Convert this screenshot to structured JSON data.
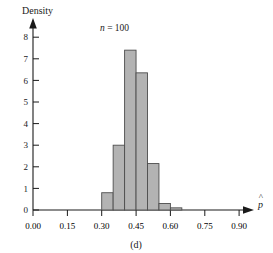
{
  "figure": {
    "caption": "(d)",
    "annotation": "n = 100",
    "annotation_var": "n",
    "annotation_rest": " = 100",
    "ylabel": "Density",
    "xlabel": "p̂",
    "xlabel_base": "p"
  },
  "chart_data": {
    "type": "bar",
    "subtype": "histogram",
    "title": "",
    "subtitle": "",
    "xlabel": "p̂",
    "ylabel": "Density",
    "annotations": [
      "n = 100",
      "(d)"
    ],
    "grid": false,
    "legend": null,
    "xlim": [
      0.0,
      0.975
    ],
    "ylim": [
      0,
      8.4
    ],
    "xticks": [
      0.0,
      0.15,
      0.3,
      0.45,
      0.6,
      0.75,
      0.9
    ],
    "xticklabels": [
      "0.00",
      "0.15",
      "0.30",
      "0.45",
      "0.60",
      "0.75",
      "0.90"
    ],
    "yticks": [
      0,
      1,
      2,
      3,
      4,
      5,
      6,
      7,
      8
    ],
    "yticklabels": [
      "0",
      "1",
      "2",
      "3",
      "4",
      "5",
      "6",
      "7",
      "8"
    ],
    "bin_width": 0.05,
    "bin_edges": [
      0.3,
      0.35,
      0.4,
      0.45,
      0.5,
      0.55,
      0.6,
      0.65
    ],
    "bin_centers": [
      0.325,
      0.375,
      0.425,
      0.475,
      0.525,
      0.575,
      0.625
    ],
    "values": [
      0.8,
      3.0,
      7.4,
      6.35,
      2.15,
      0.3,
      0.1
    ],
    "bars": [
      {
        "x0": 0.3,
        "x1": 0.35,
        "height": 0.8
      },
      {
        "x0": 0.35,
        "x1": 0.4,
        "height": 3.0
      },
      {
        "x0": 0.4,
        "x1": 0.45,
        "height": 7.4
      },
      {
        "x0": 0.45,
        "x1": 0.5,
        "height": 6.35
      },
      {
        "x0": 0.5,
        "x1": 0.55,
        "height": 2.15
      },
      {
        "x0": 0.55,
        "x1": 0.6,
        "height": 0.3
      },
      {
        "x0": 0.6,
        "x1": 0.65,
        "height": 0.1
      }
    ],
    "bar_fill": "#b3b3b3",
    "bar_edge": "#4d4d4d"
  }
}
